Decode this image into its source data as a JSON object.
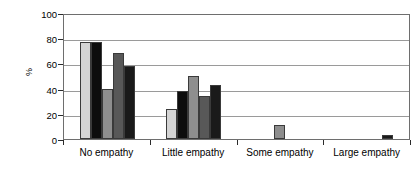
{
  "chart_data": {
    "type": "bar",
    "title": "",
    "subtitle": "",
    "xlabel": "",
    "ylabel": "%",
    "ylim": [
      0,
      100
    ],
    "yticks": [
      0,
      20,
      40,
      60,
      80,
      100
    ],
    "ytick_labels": [
      "0",
      "20",
      "40",
      "60",
      "80",
      "100"
    ],
    "grid": true,
    "grid_axis": "y",
    "legend": false,
    "legend_position": "none",
    "categories": [
      "No empathy",
      "Little empathy",
      "Some empathy",
      "Large empathy"
    ],
    "series": [
      {
        "name": "Series 1",
        "color": "#d4d4d4",
        "values": [
          77,
          24,
          0,
          0
        ]
      },
      {
        "name": "Series 2",
        "color": "#0d0d0d",
        "values": [
          77,
          38,
          0,
          0
        ]
      },
      {
        "name": "Series 3",
        "color": "#8e8e8e",
        "values": [
          40,
          50,
          11,
          0
        ]
      },
      {
        "name": "Series 4",
        "color": "#585858",
        "values": [
          68,
          34,
          0,
          0
        ]
      },
      {
        "name": "Series 5",
        "color": "#1a1a1a",
        "values": [
          58,
          43,
          0,
          3
        ]
      }
    ],
    "frame_color": "#6e6e6e",
    "gridline_color": "#9a9a9a",
    "background": "#ffffff"
  }
}
